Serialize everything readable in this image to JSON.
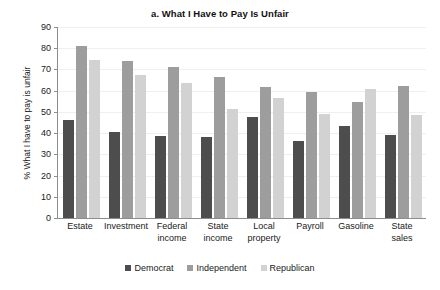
{
  "chart_data": {
    "type": "bar",
    "title": "a. What I Have to Pay Is Unfair",
    "xlabel": "",
    "ylabel": "% What I have to pay is unfair",
    "ylim": [
      0,
      90
    ],
    "ytick_step": 10,
    "yticks": [
      0,
      10,
      20,
      30,
      40,
      50,
      60,
      70,
      80,
      90
    ],
    "grid": true,
    "legend_position": "bottom",
    "categories": [
      "Estate",
      "Investment",
      "Federal income",
      "State income",
      "Local property",
      "Payroll",
      "Gasoline",
      "State sales"
    ],
    "category_lines": [
      [
        "Estate"
      ],
      [
        "Investment"
      ],
      [
        "Federal",
        "income"
      ],
      [
        "State",
        "income"
      ],
      [
        "Local",
        "property"
      ],
      [
        "Payroll"
      ],
      [
        "Gasoline"
      ],
      [
        "State",
        "sales"
      ]
    ],
    "series": [
      {
        "name": "Democrat",
        "color": "#4d4d4d",
        "values": [
          46,
          40.5,
          38.5,
          38,
          47.5,
          36.5,
          43.5,
          39
        ]
      },
      {
        "name": "Independent",
        "color": "#9d9d9d",
        "values": [
          81,
          74,
          71,
          66.5,
          61.5,
          59.5,
          54.5,
          62
        ]
      },
      {
        "name": "Republican",
        "color": "#d2d2d2",
        "values": [
          74.5,
          67.5,
          63.5,
          51.5,
          56.5,
          49,
          61,
          48.5
        ]
      }
    ]
  },
  "legend": {
    "items": [
      {
        "label": "Democrat",
        "color": "#4d4d4d"
      },
      {
        "label": "Independent",
        "color": "#9d9d9d"
      },
      {
        "label": "Republican",
        "color": "#d2d2d2"
      }
    ]
  }
}
